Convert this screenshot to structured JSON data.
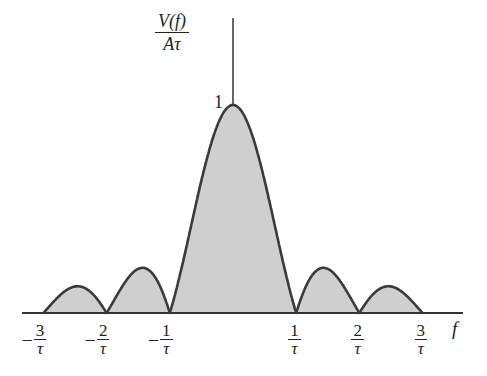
{
  "chart_data": {
    "type": "area",
    "title": "",
    "function": "|sinc(f*tau)|",
    "ylabel": "V(f) / Aτ",
    "ylabel_num": "V(f)",
    "ylabel_den": "Aτ",
    "xlabel": "f",
    "y_tick_label": "1",
    "x_ticks": [
      {
        "sign": "−",
        "num": "3",
        "den": "τ",
        "value": -3
      },
      {
        "sign": "−",
        "num": "2",
        "den": "τ",
        "value": -2
      },
      {
        "sign": "−",
        "num": "1",
        "den": "τ",
        "value": -1
      },
      {
        "sign": "",
        "num": "1",
        "den": "τ",
        "value": 1
      },
      {
        "sign": "",
        "num": "2",
        "den": "τ",
        "value": 2
      },
      {
        "sign": "",
        "num": "3",
        "den": "τ",
        "value": 3
      }
    ],
    "xlim": [
      -3.4,
      3.6
    ],
    "ylim": [
      0,
      1.35
    ],
    "zeros": [
      -3,
      -2,
      -1,
      1,
      2,
      3
    ],
    "lobe_peaks": [
      {
        "x": -2.46,
        "y": 0.13
      },
      {
        "x": -1.43,
        "y": 0.22
      },
      {
        "x": 0,
        "y": 1.0
      },
      {
        "x": 1.43,
        "y": 0.22
      },
      {
        "x": 2.46,
        "y": 0.13
      }
    ],
    "grid": false,
    "legend": null,
    "colors": {
      "fill": "#cfcfcf",
      "stroke": "#3a3a3a",
      "axis": "#333333"
    }
  }
}
